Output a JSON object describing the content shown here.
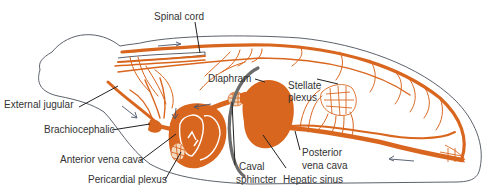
{
  "figure": {
    "colors": {
      "vessel": "#d9661f",
      "outline": "#4a4f5a",
      "diaphragm": "#6b6b6b",
      "label": "#333333"
    },
    "labels": {
      "spinal_cord": "Spinal cord",
      "diaphram": "Diaphram",
      "stellate_plexus_1": "Stellate",
      "stellate_plexus_2": "plexus",
      "external_jugular": "External jugular",
      "brachiocephalic": "Brachiocephalic",
      "anterior_vena_cava": "Anterior vena cava",
      "pericardial_plexus": "Pericardial plexus",
      "caval_sphincter_1": "Caval",
      "caval_sphincter_2": "sphincter",
      "posterior_vena_cava_1": "Posterior",
      "posterior_vena_cava_2": "vena cava",
      "hepatic_sinus": "Hepatic sinus"
    }
  }
}
